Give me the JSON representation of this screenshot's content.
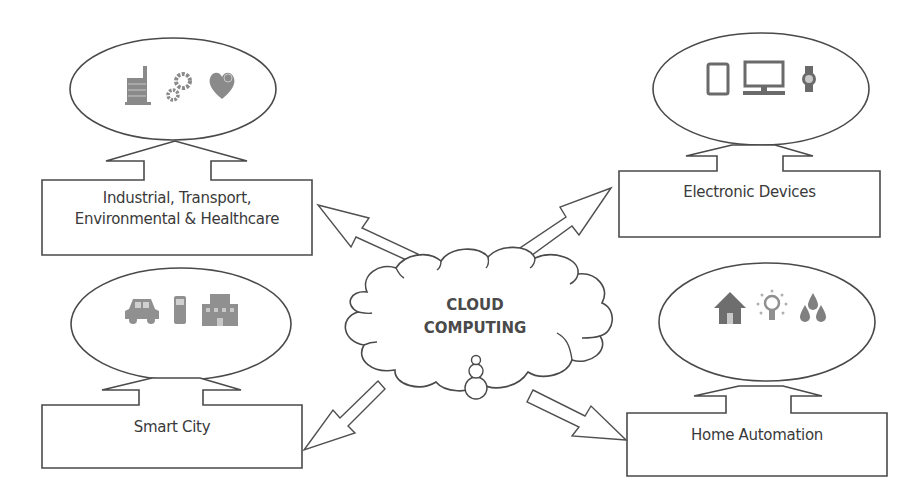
{
  "diagram": {
    "center": {
      "title_line1": "CLOUD",
      "title_line2": "COMPUTING",
      "icon": "user-icon"
    },
    "nodes": [
      {
        "id": "industrial",
        "label_line1": "Industrial, Transport,",
        "label_line2": "Environmental & Healthcare",
        "icons": [
          "factory-icon",
          "gears-icon",
          "heart-icon"
        ]
      },
      {
        "id": "electronic",
        "label_line1": "Electronic Devices",
        "label_line2": "",
        "icons": [
          "tablet-icon",
          "desktop-icon",
          "smartwatch-icon"
        ]
      },
      {
        "id": "smart-city",
        "label_line1": "Smart City",
        "label_line2": "",
        "icons": [
          "car-icon",
          "phone-icon",
          "building-icon"
        ]
      },
      {
        "id": "home",
        "label_line1": "Home Automation",
        "label_line2": "",
        "icons": [
          "house-icon",
          "lightbulb-icon",
          "water-drops-icon"
        ]
      }
    ],
    "colors": {
      "stroke": "#4a4a4a",
      "icon": "#7a7a7a",
      "text": "#3a3a3a",
      "background": "#ffffff"
    }
  }
}
